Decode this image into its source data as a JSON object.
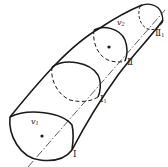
{
  "diagram": {
    "type": "streamtube",
    "stroke_color": "#1a1a1a",
    "background": "#ffffff",
    "sections": [
      {
        "id": "I",
        "label": "Ⅰ",
        "sub": ""
      },
      {
        "id": "I1",
        "label": "Ⅰ",
        "sub": "1"
      },
      {
        "id": "II",
        "label": "Ⅱ",
        "sub": ""
      },
      {
        "id": "II1",
        "label": "Ⅱ",
        "sub": "1"
      }
    ],
    "velocities": [
      {
        "id": "v1",
        "label": "v",
        "sub": "1"
      },
      {
        "id": "v2",
        "label": "v",
        "sub": "2"
      }
    ]
  }
}
